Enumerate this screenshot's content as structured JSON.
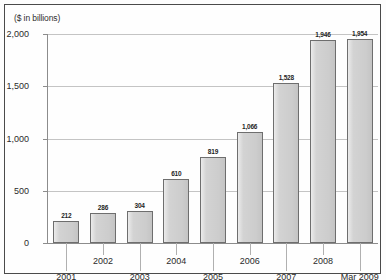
{
  "chart_data": {
    "type": "bar",
    "title": "",
    "axis_note": "($ in billions)",
    "xlabel": "",
    "ylabel": "",
    "ylim": [
      0,
      2000
    ],
    "grid": true,
    "legend": "none",
    "categories": [
      "2001",
      "2002",
      "2003",
      "2004",
      "2005",
      "2006",
      "2007",
      "2008",
      "Mar 2009"
    ],
    "values": [
      212,
      286,
      304,
      610,
      819,
      1066,
      1528,
      1946,
      1954
    ],
    "value_labels": [
      "212",
      "286",
      "304",
      "610",
      "819",
      "1,066",
      "1,528",
      "1,946",
      "1,954"
    ],
    "ytick_values": [
      0,
      500,
      1000,
      1500,
      2000
    ],
    "ytick_labels": [
      "0",
      "500",
      "1,000",
      "1,500",
      "2,000"
    ],
    "colors": {
      "bar_fill": "#d3d3d3",
      "bar_outline": "#6e6e6e",
      "gridline": "#c4c4c4",
      "axis": "#8c8c8c",
      "text": "#2b2b2b",
      "frame": "#4a4a4a",
      "background": "#fefefe"
    }
  }
}
